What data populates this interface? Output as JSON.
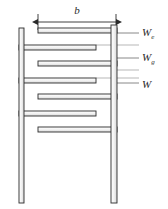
{
  "figure": {
    "type": "interdigitated-comb-cross-section",
    "background_color": "#ffffff",
    "line_color": "#2b2b2b",
    "fill_color": "#f2f2f2",
    "leader_color": "#555555"
  },
  "dimension": {
    "label": "b",
    "x_start": 38,
    "x_end": 116,
    "y": 22,
    "text_x": 77,
    "text_y": 14
  },
  "posts": [
    {
      "name": "left-post",
      "x": 19,
      "y": 28,
      "width": 5,
      "height": 175
    },
    {
      "name": "right-post",
      "x": 111,
      "y": 25,
      "width": 6,
      "height": 178
    }
  ],
  "fingers": [
    {
      "index": 1,
      "anchor": "right",
      "x": 38,
      "y": 28,
      "width": 79,
      "height": 5
    },
    {
      "index": 2,
      "anchor": "left",
      "x": 19,
      "y": 45,
      "width": 77,
      "height": 5
    },
    {
      "index": 3,
      "anchor": "right",
      "x": 38,
      "y": 61,
      "width": 79,
      "height": 5
    },
    {
      "index": 4,
      "anchor": "left",
      "x": 19,
      "y": 78,
      "width": 77,
      "height": 5
    },
    {
      "index": 5,
      "anchor": "right",
      "x": 38,
      "y": 94,
      "width": 79,
      "height": 5
    },
    {
      "index": 6,
      "anchor": "left",
      "x": 19,
      "y": 111,
      "width": 77,
      "height": 5
    },
    {
      "index": 7,
      "anchor": "right",
      "x": 38,
      "y": 127,
      "width": 79,
      "height": 5
    }
  ],
  "callouts": [
    {
      "name": "we",
      "symbol": "W",
      "subscript": "e",
      "leader_x1": 117,
      "leader_x2": 139,
      "leader_y": 33,
      "text_x": 142,
      "text_y": 36
    },
    {
      "name": "wg",
      "symbol": "W",
      "subscript": "g",
      "leader_x1": 117,
      "leader_x2": 139,
      "leader_y": 58,
      "text_x": 142,
      "text_y": 61
    },
    {
      "name": "w",
      "symbol": "W",
      "subscript": "",
      "leader_x1": 117,
      "leader_x2": 139,
      "leader_y": 83,
      "text_x": 142,
      "text_y": 88
    }
  ]
}
